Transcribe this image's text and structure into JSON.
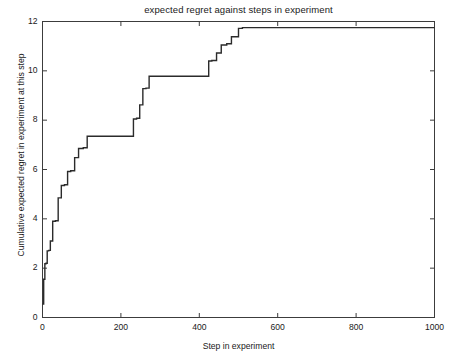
{
  "chart_data": {
    "type": "line",
    "line_style": "step-post",
    "title": "expected regret against steps in experiment",
    "xlabel": "Step in experiment",
    "ylabel": "Cumulative expected regret in experiment at this step",
    "xlim": [
      0,
      1000
    ],
    "ylim": [
      0,
      12
    ],
    "xticks": [
      0,
      200,
      400,
      600,
      800,
      1000
    ],
    "yticks": [
      0,
      2,
      4,
      6,
      8,
      10,
      12
    ],
    "xtick_labels": [
      "0",
      "200",
      "400",
      "600",
      "800",
      "1000"
    ],
    "ytick_labels": [
      "0",
      "2",
      "4",
      "6",
      "8",
      "10",
      "12"
    ],
    "grid": false,
    "legend": null,
    "series": [
      {
        "name": "Cumulative expected regret",
        "color": "#2b2b2b",
        "line_width": 1.4,
        "x": [
          0,
          3,
          6,
          9,
          12,
          16,
          20,
          26,
          33,
          40,
          48,
          56,
          64,
          72,
          82,
          92,
          104,
          114,
          222,
          232,
          240,
          248,
          256,
          264,
          272,
          414,
          424,
          432,
          444,
          456,
          470,
          482,
          500,
          510,
          1000
        ],
        "y": [
          0.55,
          1.55,
          2.18,
          2.2,
          2.7,
          2.72,
          3.1,
          3.9,
          3.92,
          4.85,
          5.35,
          5.38,
          5.92,
          5.95,
          6.48,
          6.85,
          6.88,
          7.35,
          7.35,
          8.05,
          8.08,
          8.62,
          9.28,
          9.3,
          9.78,
          9.78,
          10.4,
          10.42,
          10.72,
          11.05,
          11.1,
          11.38,
          11.72,
          11.75,
          11.75
        ]
      }
    ]
  },
  "axes": {
    "box_color": "#3c3c3c",
    "tick_direction": "in"
  }
}
